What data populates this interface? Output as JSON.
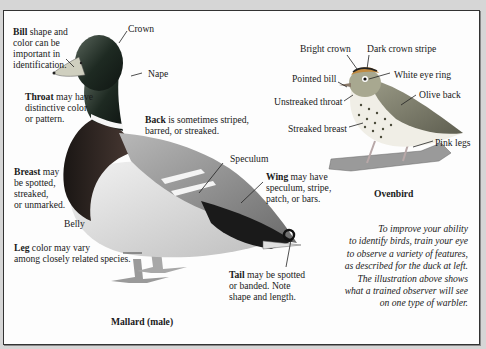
{
  "duck": {
    "bill": {
      "bold": "Bill",
      "rest1": " shape and",
      "line2": "color can be",
      "line3": "important in",
      "line4": "identification."
    },
    "crown": "Crown",
    "nape": "Nape",
    "throat": {
      "bold": "Throat",
      "rest1": " may have",
      "line2": "distinctive color",
      "line3": "or pattern."
    },
    "back": {
      "bold": "Back",
      "rest1": " is sometimes striped,",
      "line2": "barred, or streaked."
    },
    "breast": {
      "bold": "Breast",
      "rest1": " may",
      "line2": "be spotted,",
      "line3": "streaked,",
      "line4": "or unmarked."
    },
    "speculum": "Speculum",
    "wing": {
      "bold": "Wing",
      "rest1": " may have",
      "line2": "speculum, stripe,",
      "line3": "patch, or bars."
    },
    "belly": "Belly",
    "leg": {
      "bold": "Leg",
      "rest1": " color may vary",
      "line2": "among closely related species."
    },
    "tail": {
      "bold": "Tail",
      "rest1": " may be spotted",
      "line2": "or banded. Note",
      "line3": "shape and length."
    },
    "caption": "Mallard (male)"
  },
  "warbler": {
    "bright_crown": "Bright crown",
    "dark_crown_stripe": "Dark crown stripe",
    "pointed_bill": "Pointed bill",
    "white_eye_ring": "White eye ring",
    "unstreaked_throat": "Unstreaked throat",
    "olive_back": "Olive back",
    "streaked_breast": "Streaked breast",
    "pink_legs": "Pink legs",
    "caption": "Ovenbird"
  },
  "note": {
    "lines": [
      "To improve your ability",
      "to identify birds, train your eye",
      "to observe a variety of features,",
      "as described for the duck at left.",
      "The illustration above shows",
      "what a trained observer will see",
      "on one type of warbler."
    ]
  },
  "colors": {
    "page_bg": "#d6d6d6",
    "panel_bg": "#fdfdfd",
    "duck_head": "#1e2a22",
    "duck_breast": "#3a2a26",
    "warbler_back": "#8a8a70"
  }
}
